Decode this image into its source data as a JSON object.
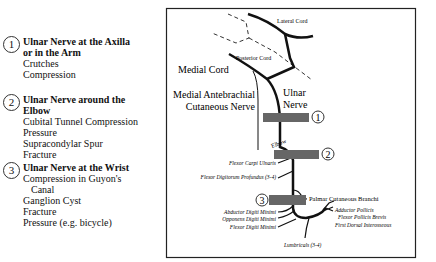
{
  "legend": {
    "entries": [
      {
        "number": "1",
        "title_line1": "Ulnar Nerve at the Axilla",
        "title_line2": "or in the Arm",
        "causes": [
          "Crutches",
          "Compression"
        ]
      },
      {
        "number": "2",
        "title_line1": "Ulnar Nerve around the",
        "title_line2": "Elbow",
        "causes": [
          "Cubital Tunnel Compression",
          "Pressure",
          "Supracondylar Spur",
          "Fracture"
        ]
      },
      {
        "number": "3",
        "title_line1": "Ulnar Nerve at the Wrist",
        "causes": [
          "Compression in Guyon's",
          "Canal",
          "Ganglion Cyst",
          "Fracture",
          "Pressure (e.g. bicycle)"
        ]
      }
    ]
  },
  "diagram": {
    "labels": {
      "lateral_cord": "Lateral Cord",
      "posterior_cord": "Posterior Cord",
      "medial_cord": "Medial Cord",
      "medial_antebrachial_1": "Medial Antebrachial",
      "medial_antebrachial_2": "Cutaneous Nerve",
      "ulnar_1": "Ulnar",
      "ulnar_2": "Nerve",
      "elbow": "Elbow",
      "flexor_carpi_ulnaris": "Flexor Carpi Ulnaris",
      "flexor_digitorum_profundus": "Flexor Digitorum Profundus (3-4)",
      "palmar_cutaneous": "Palmar Cutaneous Branchi",
      "abductor_digiti_minimi": "Abductor Digiti Minimi",
      "opponens_digiti_minimi": "Opponens Digiti Minimi",
      "flexor_digiti_minimi": "Flexor Digiti Minimi",
      "adductor_pollicis": "Adductor Pollicis",
      "flexor_pollicis_brevis": "Flexor Pollicis Brevis",
      "first_dorsal_interosseous": "First Dorsal Interosseous",
      "lumbricals": "Lumbricals (3-4)"
    },
    "markers": [
      "1",
      "2",
      "3"
    ],
    "colors": {
      "lesion_bar": "#666666",
      "nerve": "#111111",
      "border": "#222222"
    }
  }
}
